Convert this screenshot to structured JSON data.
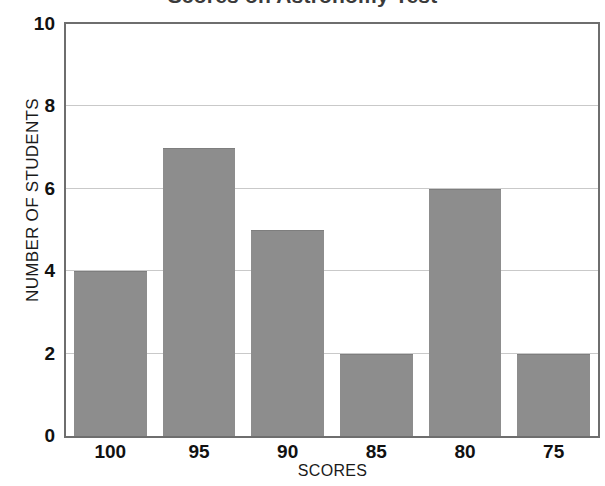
{
  "chart_data": {
    "type": "bar",
    "title": "Scores on Astronomy Test",
    "xlabel": "SCORES",
    "ylabel": "NUMBER OF STUDENTS",
    "categories": [
      "100",
      "95",
      "90",
      "85",
      "80",
      "75"
    ],
    "values": [
      4,
      7,
      5,
      2,
      6,
      2
    ],
    "ylim": [
      0,
      10
    ],
    "y_ticks": [
      10,
      8,
      6,
      4,
      2,
      0
    ],
    "y_tick_labels": [
      "10",
      "8",
      "6",
      "4",
      "2",
      "0"
    ],
    "grid": true,
    "grid_axis": "y",
    "legend": false,
    "legend_position": "none",
    "bar_color": "#8d8d8d",
    "grid_color": "#c9c9c9",
    "axis_color": "#6e6e6e",
    "text_color": "#111111",
    "title_color": "#3a3a3a",
    "background_color": "#ffffff"
  }
}
